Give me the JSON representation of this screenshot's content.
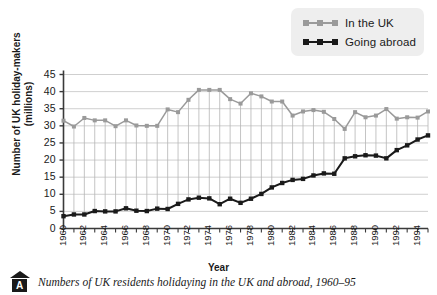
{
  "legend": {
    "position": "top-right",
    "items": [
      {
        "label": "In the UK",
        "color": "#9a9a9a",
        "icon": "line-square-marker"
      },
      {
        "label": "Going abroad",
        "color": "#1a1a1a",
        "icon": "line-square-marker"
      }
    ]
  },
  "caption": {
    "marker_letter": "A",
    "text": "Numbers of UK residents holidaying in the UK and abroad, 1960–95"
  },
  "chart_data": {
    "type": "line",
    "title": "",
    "xlabel": "Year",
    "ylabel": "Number of UK holiday-makers (millions)",
    "ylabel_lines": [
      "Number of UK holiday-makers",
      "(millions)"
    ],
    "xlim": [
      1960,
      1995
    ],
    "ylim": [
      0,
      45
    ],
    "ytick_step": 5,
    "yticks": [
      0,
      5,
      10,
      15,
      20,
      25,
      30,
      35,
      40,
      45
    ],
    "ytick_labels": [
      "0",
      "5",
      "10",
      "15",
      "20",
      "25",
      "30",
      "35",
      "40",
      "45"
    ],
    "x": [
      1960,
      1961,
      1962,
      1963,
      1964,
      1965,
      1966,
      1967,
      1968,
      1969,
      1970,
      1971,
      1972,
      1973,
      1974,
      1975,
      1976,
      1977,
      1978,
      1979,
      1980,
      1981,
      1982,
      1983,
      1984,
      1985,
      1986,
      1987,
      1988,
      1989,
      1990,
      1991,
      1992,
      1993,
      1994,
      1995
    ],
    "xtick_labels": [
      "1960",
      "1962",
      "1964",
      "1966",
      "1968",
      "1970",
      "1972",
      "1974",
      "1976",
      "1978",
      "1980",
      "1982",
      "1984",
      "1986",
      "1988",
      "1990",
      "1992",
      "1994"
    ],
    "xtick_values": [
      1960,
      1962,
      1964,
      1966,
      1968,
      1970,
      1972,
      1974,
      1976,
      1978,
      1980,
      1982,
      1984,
      1986,
      1988,
      1990,
      1992,
      1994
    ],
    "grid": "horizontal-and-drop-lines",
    "legend_position": "top-right",
    "series": [
      {
        "name": "In the UK",
        "color": "#9a9a9a",
        "values": [
          31.5,
          29.8,
          32.3,
          31.6,
          31.6,
          29.9,
          31.6,
          30.1,
          30.0,
          30.0,
          34.8,
          34.0,
          37.6,
          40.5,
          40.5,
          40.5,
          37.8,
          36.5,
          39.5,
          38.6,
          37.1,
          37.1,
          33.0,
          34.2,
          34.6,
          34.1,
          32.0,
          29.1,
          34.0,
          32.5,
          33.0,
          34.9,
          32.1,
          32.5,
          32.4,
          34.2
        ]
      },
      {
        "name": "Going abroad",
        "color": "#1a1a1a",
        "values": [
          3.6,
          4.1,
          4.1,
          5.1,
          5.0,
          5.0,
          5.9,
          5.2,
          5.1,
          5.8,
          5.7,
          7.2,
          8.5,
          9.0,
          8.8,
          7.1,
          8.7,
          7.5,
          8.7,
          10.1,
          12.0,
          13.3,
          14.2,
          14.5,
          15.5,
          16.1,
          16.0,
          20.5,
          21.1,
          21.4,
          21.3,
          20.5,
          22.9,
          24.3,
          26.0,
          27.2
        ]
      }
    ]
  }
}
